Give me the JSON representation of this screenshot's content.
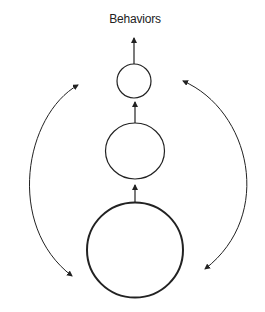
{
  "diagram": {
    "title": "Behaviors",
    "nodes": [
      {
        "id": "small-circle",
        "label": "",
        "cx": 134,
        "cy": 81,
        "rx": 17,
        "ry": 17,
        "stroke_width": 1.2
      },
      {
        "id": "medium-circle",
        "label": "",
        "cx": 135,
        "cy": 151,
        "rx": 29.5,
        "ry": 28,
        "stroke_width": 1.2
      },
      {
        "id": "large-circle",
        "label": "",
        "cx": 135,
        "cy": 250,
        "rx": 48,
        "ry": 47.5,
        "stroke_width": 2
      }
    ],
    "edges": [
      {
        "from": "large-circle",
        "to": "medium-circle",
        "type": "straight-arrow"
      },
      {
        "from": "medium-circle",
        "to": "small-circle",
        "type": "straight-arrow"
      },
      {
        "from": "small-circle",
        "to": "Behaviors",
        "type": "straight-arrow"
      },
      {
        "side": "left",
        "type": "curved-double-arrow"
      },
      {
        "side": "right",
        "type": "curved-double-arrow"
      }
    ],
    "colors": {
      "stroke": "#222222",
      "background": "#ffffff"
    }
  }
}
